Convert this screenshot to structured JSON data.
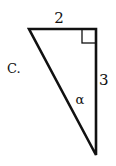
{
  "diagram": {
    "option_label": "C.",
    "top_side_label": "2",
    "right_side_label": "3",
    "angle_label": "α",
    "right_angle_marker": true,
    "vertices": {
      "top_left": [
        29,
        29
      ],
      "top_right": [
        96,
        29
      ],
      "bottom": [
        96,
        155
      ]
    },
    "stroke_color": "#111111"
  }
}
